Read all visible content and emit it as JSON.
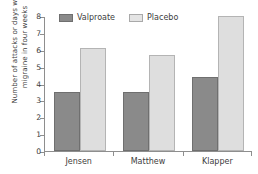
{
  "chart_data": {
    "type": "bar",
    "title": "",
    "subtitle": "",
    "xlabel": "",
    "ylabel": "Number of attacks or days with migraine in four weeks",
    "ylabel_lines": [
      "Number of attacks or days with",
      "migraine in four weeks"
    ],
    "categories": [
      "Jensen",
      "Matthew",
      "Klapper"
    ],
    "series": [
      {
        "name": "Valproate",
        "color": "#8a8a8a",
        "values": [
          3.5,
          3.5,
          4.4
        ]
      },
      {
        "name": "Placebo",
        "color": "#dedede",
        "values": [
          6.1,
          5.7,
          8.0
        ]
      }
    ],
    "ylim": [
      0,
      8
    ],
    "ytick_values": [
      0,
      1,
      2,
      3,
      4,
      5,
      6,
      7,
      8
    ],
    "ytick_labels": [
      "0",
      "1",
      "2",
      "3",
      "4",
      "5",
      "6",
      "7",
      "8"
    ],
    "grid": false,
    "legend_position": "top",
    "legend_entries": [
      "Valproate",
      "Placebo"
    ]
  },
  "axis": {
    "y_title_line1": "Number of attacks or days with",
    "y_title_line2": "migraine in four weeks"
  },
  "legend": {
    "valproate_label": "Valproate",
    "placebo_label": "Placebo"
  }
}
